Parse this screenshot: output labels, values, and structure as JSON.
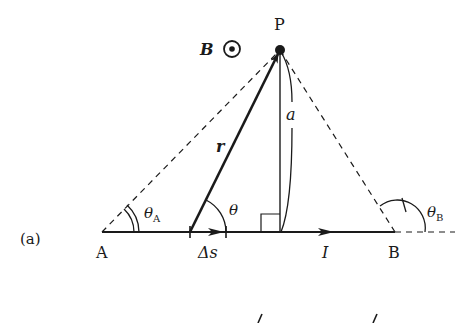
{
  "figure": {
    "panel_label": "(a)",
    "points": {
      "P": {
        "label": "P",
        "x": 280,
        "y": 50
      },
      "A": {
        "label": "A",
        "x": 102,
        "y": 232
      },
      "B": {
        "label": "B",
        "x": 395,
        "y": 232
      },
      "foot": {
        "x": 280,
        "y": 232
      }
    },
    "labels": {
      "field": "B",
      "field_symbol": "⊙",
      "position_vector": "r",
      "distance": "a",
      "element": "Δs",
      "current": "I",
      "angle": "θ",
      "angle_A": "θ",
      "angle_A_sub": "A",
      "angle_B": "θ",
      "angle_B_sub": "B"
    },
    "colors": {
      "ink": "#1a1a1a",
      "background": "#ffffff"
    }
  }
}
